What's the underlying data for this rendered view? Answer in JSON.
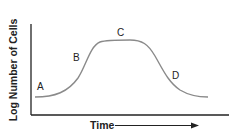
{
  "diagram": {
    "y_axis_label": "Log Number of Cells",
    "x_axis_label": "Time",
    "phase_labels": [
      {
        "id": "A",
        "x": 41,
        "y": 90
      },
      {
        "id": "B",
        "x": 77,
        "y": 61
      },
      {
        "id": "C",
        "x": 121,
        "y": 36
      },
      {
        "id": "D",
        "x": 176,
        "y": 79
      }
    ],
    "colors": {
      "axes": "#222222",
      "curve": "#8a8a8a",
      "text": "#222222"
    }
  }
}
